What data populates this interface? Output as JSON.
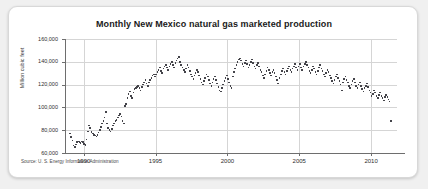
{
  "card": {
    "background_color": "#ffffff",
    "border_color": "#d8d8d8"
  },
  "source": {
    "text": "Source: U. S. Energy Information Administration"
  },
  "chart_data": {
    "type": "scatter",
    "title": "Monthly New Mexico natural gas marketed production",
    "xlabel": "",
    "ylabel": "Million cubic feet",
    "xlim": [
      1988.7,
      2011.8
    ],
    "ylim": [
      60000,
      160000
    ],
    "grid": true,
    "legend": null,
    "marker_color": "#44444a",
    "ytick_labels": [
      "160,000",
      "140,000",
      "120,000",
      "100,000",
      "80,000",
      "60,000"
    ],
    "ytick_values": [
      160000,
      140000,
      120000,
      100000,
      80000,
      60000
    ],
    "xtick_labels": [
      "1990",
      "1995",
      "2000",
      "2005",
      "2010"
    ],
    "xtick_values": [
      1990,
      1995,
      2000,
      2005,
      2010
    ],
    "x": [
      1989.04,
      1989.13,
      1989.21,
      1989.29,
      1989.38,
      1989.46,
      1989.54,
      1989.63,
      1989.71,
      1989.79,
      1989.88,
      1989.96,
      1990.04,
      1990.13,
      1990.21,
      1990.29,
      1990.38,
      1990.46,
      1990.54,
      1990.63,
      1990.71,
      1990.79,
      1990.88,
      1990.96,
      1991.04,
      1991.13,
      1991.21,
      1991.29,
      1991.38,
      1991.46,
      1991.54,
      1991.63,
      1991.71,
      1991.79,
      1991.88,
      1991.96,
      1992.04,
      1992.13,
      1992.21,
      1992.29,
      1992.38,
      1992.46,
      1992.54,
      1992.63,
      1992.71,
      1992.79,
      1992.88,
      1992.96,
      1993.04,
      1993.13,
      1993.21,
      1993.29,
      1993.38,
      1993.46,
      1993.54,
      1993.63,
      1993.71,
      1993.79,
      1993.88,
      1993.96,
      1994.04,
      1994.13,
      1994.21,
      1994.29,
      1994.38,
      1994.46,
      1994.54,
      1994.63,
      1994.71,
      1994.79,
      1994.88,
      1994.96,
      1995.04,
      1995.13,
      1995.21,
      1995.29,
      1995.38,
      1995.46,
      1995.54,
      1995.63,
      1995.71,
      1995.79,
      1995.88,
      1995.96,
      1996.04,
      1996.13,
      1996.21,
      1996.29,
      1996.38,
      1996.46,
      1996.54,
      1996.63,
      1996.71,
      1996.79,
      1996.88,
      1996.96,
      1997.04,
      1997.13,
      1997.21,
      1997.29,
      1997.38,
      1997.46,
      1997.54,
      1997.63,
      1997.71,
      1997.79,
      1997.88,
      1997.96,
      1998.04,
      1998.13,
      1998.21,
      1998.29,
      1998.38,
      1998.46,
      1998.54,
      1998.63,
      1998.71,
      1998.79,
      1998.88,
      1998.96,
      1999.04,
      1999.13,
      1999.21,
      1999.29,
      1999.38,
      1999.46,
      1999.54,
      1999.63,
      1999.71,
      1999.79,
      1999.88,
      1999.96,
      2000.04,
      2000.13,
      2000.21,
      2000.29,
      2000.38,
      2000.46,
      2000.54,
      2000.63,
      2000.71,
      2000.79,
      2000.88,
      2000.96,
      2001.04,
      2001.13,
      2001.21,
      2001.29,
      2001.38,
      2001.46,
      2001.54,
      2001.63,
      2001.71,
      2001.79,
      2001.88,
      2001.96,
      2002.04,
      2002.13,
      2002.21,
      2002.29,
      2002.38,
      2002.46,
      2002.54,
      2002.63,
      2002.71,
      2002.79,
      2002.88,
      2002.96,
      2003.04,
      2003.13,
      2003.21,
      2003.29,
      2003.38,
      2003.46,
      2003.54,
      2003.63,
      2003.71,
      2003.79,
      2003.88,
      2003.96,
      2004.04,
      2004.13,
      2004.21,
      2004.29,
      2004.38,
      2004.46,
      2004.54,
      2004.63,
      2004.71,
      2004.79,
      2004.88,
      2004.96,
      2005.04,
      2005.13,
      2005.21,
      2005.29,
      2005.38,
      2005.46,
      2005.54,
      2005.63,
      2005.71,
      2005.79,
      2005.88,
      2005.96,
      2006.04,
      2006.13,
      2006.21,
      2006.29,
      2006.38,
      2006.46,
      2006.54,
      2006.63,
      2006.71,
      2006.79,
      2006.88,
      2006.96,
      2007.04,
      2007.13,
      2007.21,
      2007.29,
      2007.38,
      2007.46,
      2007.54,
      2007.63,
      2007.71,
      2007.79,
      2007.88,
      2007.96,
      2008.04,
      2008.13,
      2008.21,
      2008.29,
      2008.38,
      2008.46,
      2008.54,
      2008.63,
      2008.71,
      2008.79,
      2008.88,
      2008.96,
      2009.04,
      2009.13,
      2009.21,
      2009.29,
      2009.38,
      2009.46,
      2009.54,
      2009.63,
      2009.71,
      2009.79,
      2009.88,
      2009.96,
      2010.04,
      2010.13,
      2010.21,
      2010.29,
      2010.38,
      2010.46,
      2010.54,
      2010.63,
      2010.71,
      2010.79,
      2010.88,
      2010.96,
      2011.04,
      2011.13,
      2011.21,
      2011.29,
      2011.38
    ],
    "y": [
      77000,
      74000,
      71000,
      66500,
      65500,
      67500,
      69500,
      70000,
      69500,
      69000,
      70000,
      69500,
      68000,
      67000,
      72000,
      79000,
      84000,
      82000,
      78500,
      77000,
      76000,
      75500,
      74500,
      76000,
      78000,
      80000,
      83000,
      86000,
      88000,
      91000,
      96000,
      86000,
      82000,
      80000,
      79000,
      81000,
      84000,
      86000,
      88000,
      89000,
      91000,
      93000,
      94000,
      92000,
      88000,
      86000,
      101000,
      103000,
      108000,
      112000,
      114000,
      110000,
      108000,
      113000,
      116000,
      117000,
      118000,
      119000,
      117000,
      115000,
      118000,
      120000,
      122000,
      124000,
      121000,
      119000,
      122000,
      124000,
      126000,
      128000,
      129000,
      127000,
      129000,
      131000,
      133000,
      135000,
      132000,
      130000,
      134000,
      136000,
      137000,
      135000,
      133000,
      136000,
      138000,
      140000,
      137000,
      135000,
      139000,
      141000,
      143000,
      144000,
      140000,
      137000,
      135000,
      133000,
      131000,
      134000,
      137000,
      135000,
      132000,
      129000,
      127000,
      125000,
      128000,
      130000,
      133000,
      131000,
      128000,
      125000,
      122000,
      120000,
      123000,
      126000,
      129000,
      127000,
      124000,
      121000,
      119000,
      122000,
      125000,
      127000,
      124000,
      121000,
      118000,
      115000,
      114000,
      117000,
      120000,
      123000,
      126000,
      128000,
      125000,
      122000,
      119000,
      117000,
      127000,
      131000,
      134000,
      137000,
      140000,
      142000,
      143000,
      141000,
      138000,
      136000,
      139000,
      141000,
      138000,
      135000,
      137000,
      140000,
      142000,
      139000,
      136000,
      134000,
      137000,
      139000,
      136000,
      133000,
      131000,
      128000,
      126000,
      129000,
      132000,
      135000,
      133000,
      130000,
      128000,
      131000,
      133000,
      130000,
      127000,
      124000,
      121000,
      126000,
      129000,
      132000,
      134000,
      131000,
      129000,
      132000,
      134000,
      136000,
      133000,
      131000,
      134000,
      136000,
      138000,
      135000,
      133000,
      136000,
      138000,
      135000,
      133000,
      136000,
      138000,
      140000,
      137000,
      135000,
      132000,
      130000,
      133000,
      136000,
      134000,
      131000,
      129000,
      132000,
      135000,
      137000,
      134000,
      132000,
      129000,
      127000,
      130000,
      133000,
      131000,
      128000,
      126000,
      123000,
      121000,
      124000,
      127000,
      129000,
      126000,
      123000,
      120000,
      115000,
      122000,
      125000,
      127000,
      124000,
      122000,
      119000,
      117000,
      120000,
      123000,
      125000,
      122000,
      119000,
      117000,
      120000,
      122000,
      119000,
      116000,
      114000,
      117000,
      119000,
      121000,
      118000,
      115000,
      113000,
      110000,
      112000,
      115000,
      113000,
      110000,
      108000,
      111000,
      113000,
      110000,
      108000,
      106000,
      109000,
      111000,
      109000,
      107000,
      105000,
      88000
    ]
  }
}
